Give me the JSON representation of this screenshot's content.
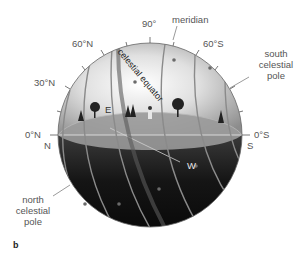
{
  "diagram": {
    "figure_letter": "b",
    "labels": {
      "meridian": "meridian",
      "deg_90": "90°",
      "deg_60N": "60°N",
      "deg_60S": "60°S",
      "deg_30N": "30°N",
      "deg_0N": "0°N",
      "deg_0S": "0°S",
      "celestial_equator": "celestial equator",
      "south_celestial_pole": [
        "south",
        "celestial",
        "pole"
      ],
      "north_celestial_pole": [
        "north",
        "celestial",
        "pole"
      ],
      "east": "E",
      "west": "W",
      "north": "N",
      "south": "S"
    },
    "colors": {
      "sky_light": "#f2f2f2",
      "sky_mid": "#a8a8a8",
      "horizon_plane": "#8e8e8e",
      "below_horizon": "#1a1a1a",
      "star_trail": "#7a7a7a",
      "equator_band": "#5a5a5a",
      "label_text": "#555555"
    }
  }
}
